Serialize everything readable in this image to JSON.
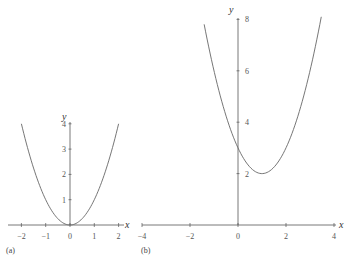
{
  "chart_data": [
    {
      "type": "line",
      "panel_label": "(a)",
      "title": "",
      "xlabel": "x",
      "ylabel": "y",
      "function": "y = x^2",
      "xlim": [
        -2.3,
        2.3
      ],
      "ylim": [
        0,
        4
      ],
      "x_ticks": [
        -2,
        -1,
        0,
        1,
        2
      ],
      "x_tick_labels": [
        "−2",
        "−1",
        "0",
        "1",
        "2"
      ],
      "y_ticks": [
        1,
        2,
        3,
        4
      ],
      "y_tick_labels": [
        "1",
        "2",
        "3",
        "4"
      ],
      "grid": false,
      "series": [
        {
          "name": "y = x^2",
          "x": [
            -2,
            -1.5,
            -1,
            -0.5,
            0,
            0.5,
            1,
            1.5,
            2
          ],
          "y": [
            4,
            2.25,
            1,
            0.25,
            0,
            0.25,
            1,
            2.25,
            4
          ]
        }
      ]
    },
    {
      "type": "line",
      "panel_label": "(b)",
      "title": "",
      "xlabel": "x",
      "ylabel": "y",
      "function": "y = x^2 - 2x + 3",
      "xlim": [
        -4,
        4.3
      ],
      "ylim": [
        0,
        8
      ],
      "x_ticks": [
        -4,
        -2,
        0,
        2,
        4
      ],
      "x_tick_labels": [
        "−4",
        "−2",
        "0",
        "2",
        "4"
      ],
      "y_ticks": [
        2,
        4,
        6,
        8
      ],
      "y_tick_labels": [
        "2",
        "4",
        "6",
        "8"
      ],
      "grid": false,
      "series": [
        {
          "name": "y = x^2 - 2x + 3",
          "x": [
            -1.4,
            -1,
            0,
            1,
            2,
            3,
            3.5
          ],
          "y": [
            7.76,
            6,
            3,
            2,
            3,
            6,
            8.25
          ]
        }
      ]
    }
  ]
}
